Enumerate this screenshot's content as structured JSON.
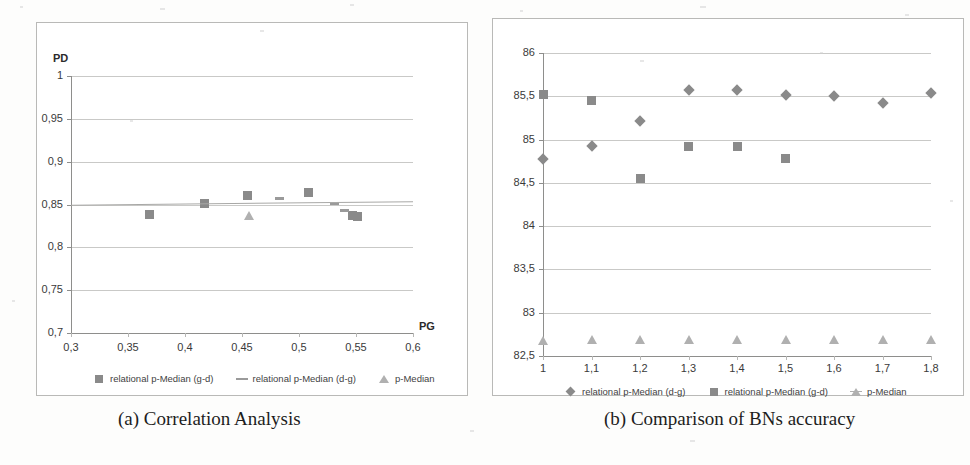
{
  "figure": {
    "panels": [
      {
        "caption": "(a) Correlation Analysis"
      },
      {
        "caption": "(b) Comparison of BNs accuracy"
      }
    ]
  },
  "chart_data": [
    {
      "type": "scatter",
      "title": "(a) Correlation Analysis",
      "xlabel": "PG",
      "ylabel": "PD",
      "xlim": [
        0.3,
        0.6
      ],
      "ylim": [
        0.7,
        1.0
      ],
      "xticks": [
        "0,3",
        "0,35",
        "0,4",
        "0,45",
        "0,5",
        "0,55",
        "0,6"
      ],
      "yticks": [
        "0,7",
        "0,75",
        "0,8",
        "0,85",
        "0,9",
        "0,95",
        "1"
      ],
      "grid": true,
      "legend_position": "bottom",
      "series": [
        {
          "name": "relational p-Median (g-d)",
          "marker": "square",
          "color": "#8a8a8a",
          "points": [
            {
              "x": 0.369,
              "y": 0.838
            },
            {
              "x": 0.417,
              "y": 0.851
            },
            {
              "x": 0.455,
              "y": 0.861
            },
            {
              "x": 0.508,
              "y": 0.864
            },
            {
              "x": 0.547,
              "y": 0.837
            },
            {
              "x": 0.551,
              "y": 0.836
            }
          ]
        },
        {
          "name": "relational p-Median (d-g)",
          "marker": "dash",
          "color": "#9a9a9a",
          "points": [
            {
              "x": 0.483,
              "y": 0.857
            },
            {
              "x": 0.531,
              "y": 0.851
            },
            {
              "x": 0.54,
              "y": 0.843
            }
          ]
        },
        {
          "name": "p-Median",
          "marker": "triangle",
          "color": "#b0b0b0",
          "points": [
            {
              "x": 0.456,
              "y": 0.837
            }
          ]
        }
      ]
    },
    {
      "type": "scatter",
      "title": "(b) Comparison of BNs accuracy",
      "xlabel": "",
      "ylabel": "",
      "xlim": [
        1.0,
        1.8
      ],
      "ylim": [
        82.5,
        86.0
      ],
      "xticks": [
        "1",
        "1,1",
        "1,2",
        "1,3",
        "1,4",
        "1,5",
        "1,6",
        "1,7",
        "1,8"
      ],
      "yticks": [
        "82,5",
        "83",
        "83,5",
        "84",
        "84,5",
        "85",
        "85,5",
        "86"
      ],
      "grid": true,
      "legend_position": "bottom",
      "x": [
        1.0,
        1.1,
        1.2,
        1.3,
        1.4,
        1.5,
        1.6,
        1.7,
        1.8
      ],
      "series": [
        {
          "name": "relational p-Median (d-g)",
          "marker": "diamond",
          "color": "#8a8a8a",
          "values": [
            84.78,
            84.93,
            85.21,
            85.57,
            85.57,
            85.52,
            85.5,
            85.42,
            85.54
          ]
        },
        {
          "name": "relational p-Median (g-d)",
          "marker": "square",
          "color": "#8a8a8a",
          "values": [
            85.52,
            85.45,
            84.55,
            84.92,
            84.92,
            84.78,
            null,
            null,
            null
          ]
        },
        {
          "name": "p-Median",
          "marker": "triangle",
          "color": "#b0b0b0",
          "values": [
            82.67,
            82.68,
            82.68,
            82.68,
            82.68,
            82.68,
            82.68,
            82.68,
            82.68
          ]
        }
      ]
    }
  ]
}
